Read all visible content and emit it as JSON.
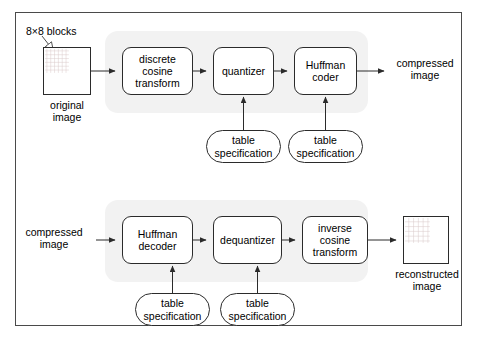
{
  "figure": {
    "frame_color": "#4a4a4a",
    "group_band_color": "#f2f2f2",
    "line_color": "#2b2b2b"
  },
  "encoder": {
    "input_square_label": "original\nimage",
    "callout_label": "8×8 blocks",
    "stages": [
      {
        "id": "dct",
        "label": "discrete\ncosine\ntransform"
      },
      {
        "id": "quantizer",
        "label": "quantizer"
      },
      {
        "id": "huffman_coder",
        "label": "Huffman\ncoder"
      }
    ],
    "tables": [
      {
        "id": "table_spec_quantizer",
        "label": "table\nspecification"
      },
      {
        "id": "table_spec_coder",
        "label": "table\nspecification"
      }
    ],
    "output_label": "compressed\nimage"
  },
  "decoder": {
    "input_label": "compressed\nimage",
    "stages": [
      {
        "id": "huffman_decoder",
        "label": "Huffman\ndecoder"
      },
      {
        "id": "dequantizer",
        "label": "dequantizer"
      },
      {
        "id": "inverse_dct",
        "label": "inverse\ncosine\ntransform"
      }
    ],
    "tables": [
      {
        "id": "table_spec_decoder",
        "label": "table\nspecification"
      },
      {
        "id": "table_spec_dequantizer",
        "label": "table\nspecification"
      }
    ],
    "output_square_label": "reconstructed\nimage"
  }
}
